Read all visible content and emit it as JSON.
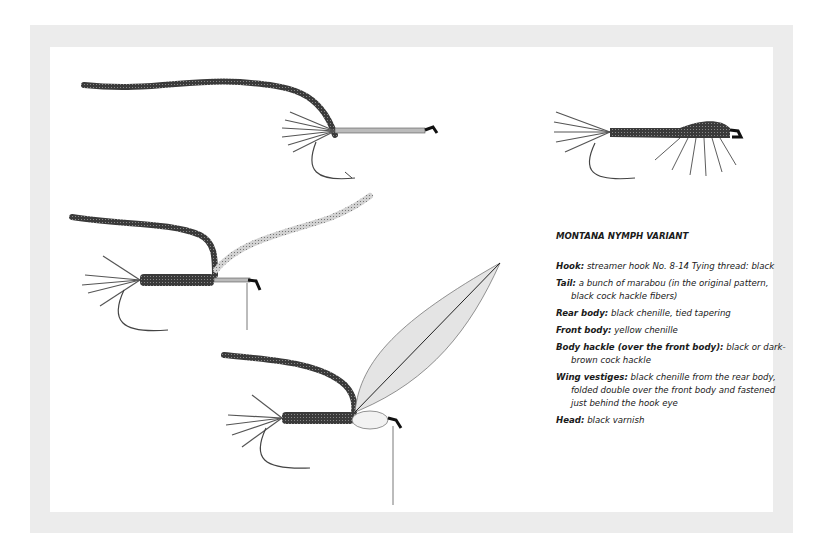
{
  "title": "MONTANA NYMPH VARIANT",
  "entries": [
    {
      "label": "Hook:",
      "text": " streamer hook No. 8-14 Tying thread: black"
    },
    {
      "label": "Tail:",
      "text": " a bunch of marabou (in the original pattern, black cock hackle fibers)"
    },
    {
      "label": "Rear body:",
      "text": " black chenille, tied tapering"
    },
    {
      "label": "Front body:",
      "text": " yellow chenille"
    },
    {
      "label": "Body hackle (over the front body):",
      "text": " black or dark-brown cock hackle"
    },
    {
      "label": "Wing vestiges:",
      "text": " black chenille from the rear body, folded double over the front body and fastened just behind the hook eye"
    },
    {
      "label": "Head:",
      "text": " black varnish"
    }
  ],
  "illustrations": [
    {
      "name": "step-1-chenille-tied-in"
    },
    {
      "name": "finished-fly"
    },
    {
      "name": "step-2-rear-body-wound"
    },
    {
      "name": "step-3-hackle-tied-in"
    }
  ],
  "colors": {
    "frame": "#ececec",
    "ink": "#1a1a1a",
    "chenille": "#3a3a3a",
    "light_chenille": "#bdbdbd"
  }
}
